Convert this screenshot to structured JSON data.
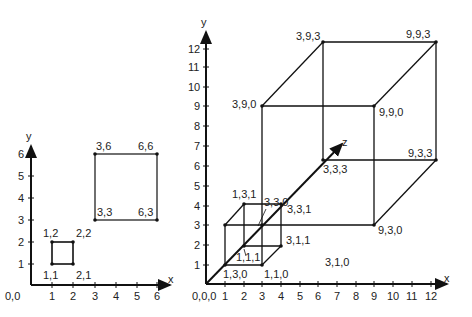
{
  "left_plot": {
    "axis_x_label": "x",
    "axis_y_label": "y",
    "origin_label": "0,0",
    "x_ticks": [
      "1",
      "2",
      "3",
      "4",
      "5",
      "6"
    ],
    "y_ticks": [
      "1",
      "2",
      "3",
      "4",
      "5",
      "6"
    ],
    "small_square": {
      "labels": [
        "1,1",
        "2,1",
        "2,2",
        "1,2"
      ]
    },
    "large_square": {
      "labels": [
        "3,3",
        "6,3",
        "6,6",
        "3,6"
      ]
    }
  },
  "right_plot": {
    "axis_x_label": "x",
    "axis_y_label": "y",
    "axis_z_label": "z",
    "origin_label": "0,0,0",
    "x_ticks": [
      "1",
      "2",
      "3",
      "4",
      "5",
      "6",
      "7",
      "8",
      "9",
      "10",
      "11",
      "12"
    ],
    "y_ticks": [
      "1",
      "2",
      "3",
      "4",
      "5",
      "6",
      "7",
      "8",
      "9",
      "10",
      "11",
      "12"
    ],
    "small_cube_labels": {
      "p130": "1,3,0",
      "p110": "1,1,0",
      "p111": "1,1,1",
      "p311": "3,1,1",
      "p131": "1,3,1",
      "p331": "3,3,1",
      "p330": "3,3,0"
    },
    "large_cube_labels": {
      "p390": "3,9,0",
      "p393": "3,9,3",
      "p993": "9,9,3",
      "p990": "9,9,0",
      "p333": "3,3,3",
      "p933": "9,3,3",
      "p930": "9,3,0",
      "p310": "3,1,0"
    }
  }
}
